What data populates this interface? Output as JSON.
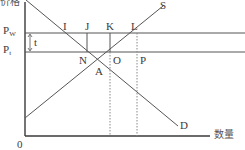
{
  "diagram": {
    "axes": {
      "y_label": "价格",
      "x_label": "数量",
      "origin_label": "0"
    },
    "price_levels": {
      "world": {
        "symbol": "P",
        "subscript": "W"
      },
      "tariff": {
        "symbol": "P",
        "subscript": "t"
      },
      "tariff_gap_label": "t"
    },
    "curves": {
      "supply": "S",
      "demand": "D"
    },
    "points": {
      "I": "I",
      "J": "J",
      "K": "K",
      "L": "L",
      "N": "N",
      "O": "O",
      "P": "P",
      "A": "A"
    },
    "colors": {
      "axis": "#3a3a3a",
      "line": "#555555",
      "dotted": "#888888",
      "text": "#3a3a3a"
    }
  }
}
